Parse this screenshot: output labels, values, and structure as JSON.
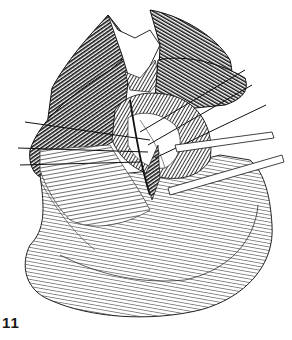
{
  "figure": {
    "label": "11",
    "colors": {
      "ink": "#111111",
      "paper": "#ffffff"
    }
  }
}
